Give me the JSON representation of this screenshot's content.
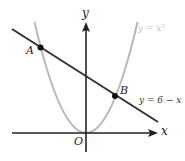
{
  "figure": {
    "axes": {
      "x_label": "x",
      "y_label": "y",
      "origin_label": "O"
    },
    "curves": [
      {
        "name": "parabola",
        "label": "y = x²",
        "color": "#b8b8b8"
      },
      {
        "name": "line",
        "label": "y = 6 − x",
        "color": "#333333"
      }
    ],
    "points": [
      {
        "label": "A",
        "x": -3,
        "y": 9
      },
      {
        "label": "B",
        "x": 2,
        "y": 4
      }
    ]
  }
}
